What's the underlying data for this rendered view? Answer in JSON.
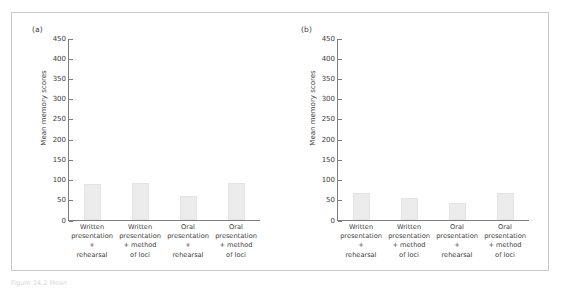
{
  "figure": {
    "caption": "Figure 14.2  Mean"
  },
  "chart_data": [
    {
      "type": "bar",
      "panel_label": "(a)",
      "title": "",
      "xlabel": "",
      "ylabel": "Mean memory scores",
      "categories": [
        "Written presentation + rehearsal",
        "Written presentation + method of loci",
        "Oral presentation + rehearsal",
        "Oral presentation + method of loci"
      ],
      "category_lines": [
        [
          "Written",
          "presentation",
          "+",
          "rehearsal"
        ],
        [
          "Written",
          "presentation",
          "+ method",
          "of loci"
        ],
        [
          "Oral",
          "presentation",
          "+",
          "rehearsal"
        ],
        [
          "Oral",
          "presentation",
          "+ method",
          "of loci"
        ]
      ],
      "values": [
        90,
        92,
        60,
        92
      ],
      "ylim": [
        0,
        450
      ],
      "yticks": [
        0,
        50,
        100,
        150,
        200,
        250,
        300,
        350,
        400,
        450
      ],
      "grid": false,
      "legend": "none",
      "bar_color": "#ececed"
    },
    {
      "type": "bar",
      "panel_label": "(b)",
      "title": "",
      "xlabel": "",
      "ylabel": "Mean memory scores",
      "categories": [
        "Written presentation + rehearsal",
        "Written presentation + method of loci",
        "Oral presentation + rehearsal",
        "Oral presentation + method of loci"
      ],
      "category_lines": [
        [
          "Written",
          "presentation",
          "+",
          "rehearsal"
        ],
        [
          "Written",
          "presentation",
          "+ method",
          "of loci"
        ],
        [
          "Oral",
          "presentation",
          "+",
          "rehearsal"
        ],
        [
          "Oral",
          "presentation",
          "+ method",
          "of loci"
        ]
      ],
      "values": [
        66,
        55,
        43,
        66
      ],
      "ylim": [
        0,
        450
      ],
      "yticks": [
        0,
        50,
        100,
        150,
        200,
        250,
        300,
        350,
        400,
        450
      ],
      "grid": false,
      "legend": "none",
      "bar_color": "#ececed"
    }
  ]
}
